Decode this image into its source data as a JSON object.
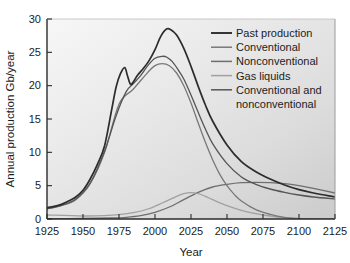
{
  "chart_data": {
    "type": "line",
    "title": "",
    "xlabel": "Year",
    "ylabel": "Annual production Gb/year",
    "xlim": [
      1925,
      2125
    ],
    "ylim": [
      0,
      30
    ],
    "xticks": [
      1925,
      1950,
      1975,
      2000,
      2025,
      2050,
      2075,
      2100,
      2125
    ],
    "yticks": [
      0,
      5,
      10,
      15,
      20,
      25,
      30
    ],
    "grid": false,
    "legend_position": "top-right inside axes",
    "series": [
      {
        "name": "Past production",
        "color": "#2c2c2c",
        "x": [
          1925,
          1930,
          1935,
          1940,
          1945,
          1950,
          1955,
          1960,
          1965,
          1970,
          1973,
          1976,
          1979,
          1981,
          1983,
          1985,
          1988,
          1992,
          1996,
          2000,
          2004,
          2008,
          2011,
          2015,
          2020,
          2025,
          2030,
          2035,
          2040,
          2050,
          2060,
          2070,
          2080,
          2090,
          2100,
          2110,
          2125
        ],
        "values": [
          1.7,
          1.9,
          2.2,
          2.7,
          3.3,
          4.3,
          6.0,
          8.2,
          11.0,
          16.5,
          19.8,
          21.8,
          22.7,
          21.4,
          20.2,
          20.6,
          21.6,
          22.6,
          23.8,
          25.4,
          27.4,
          28.5,
          28.4,
          27.6,
          25.6,
          22.9,
          19.9,
          17.1,
          14.7,
          11.1,
          8.6,
          7.1,
          6.0,
          5.1,
          4.4,
          3.9,
          3.3
        ]
      },
      {
        "name": "Conventional",
        "color": "#787878",
        "x": [
          1925,
          1935,
          1945,
          1955,
          1965,
          1975,
          1985,
          1995,
          2000,
          2005,
          2010,
          2015,
          2020,
          2025,
          2030,
          2035,
          2040,
          2045,
          2050,
          2055,
          2060,
          2070,
          2080,
          2090,
          2100,
          2110,
          2125
        ],
        "values": [
          1.5,
          2.0,
          2.9,
          5.3,
          10.0,
          17.2,
          19.5,
          22.0,
          23.0,
          23.3,
          23.0,
          21.9,
          20.0,
          17.4,
          14.4,
          11.5,
          8.9,
          6.7,
          5.0,
          3.7,
          2.7,
          1.4,
          0.7,
          0.25,
          0.05,
          0.0,
          0.0
        ]
      },
      {
        "name": "Nonconventional",
        "color": "#6e6e6e",
        "x": [
          1925,
          1950,
          1970,
          1980,
          1990,
          2000,
          2010,
          2020,
          2030,
          2040,
          2050,
          2060,
          2070,
          2080,
          2090,
          2100,
          2110,
          2125
        ],
        "values": [
          0.05,
          0.08,
          0.15,
          0.25,
          0.5,
          1.0,
          1.8,
          2.9,
          4.0,
          4.8,
          5.2,
          5.45,
          5.5,
          5.45,
          5.3,
          5.0,
          4.6,
          3.9
        ]
      },
      {
        "name": "Gas liquids",
        "color": "#a0a0a0",
        "x": [
          1925,
          1950,
          1965,
          1975,
          1985,
          1995,
          2005,
          2015,
          2020,
          2025,
          2030,
          2035,
          2040,
          2050,
          2060,
          2070,
          2080,
          2090,
          2100,
          2110,
          2125
        ],
        "values": [
          0.6,
          0.45,
          0.5,
          0.65,
          0.95,
          1.5,
          2.4,
          3.4,
          3.8,
          3.95,
          3.8,
          3.4,
          2.9,
          2.0,
          1.3,
          0.8,
          0.45,
          0.2,
          0.05,
          0.0,
          0.0
        ]
      },
      {
        "name": "Conventional and nonconventional",
        "color": "#555555",
        "x": [
          1925,
          1935,
          1945,
          1955,
          1965,
          1973,
          1980,
          1985,
          1990,
          1995,
          2000,
          2005,
          2008,
          2012,
          2016,
          2020,
          2025,
          2030,
          2035,
          2040,
          2050,
          2060,
          2070,
          2080,
          2090,
          2100,
          2110,
          2125
        ],
        "values": [
          1.55,
          2.05,
          3.0,
          5.4,
          10.2,
          15.5,
          19.1,
          20.3,
          21.5,
          23.0,
          24.1,
          24.4,
          24.3,
          23.6,
          22.4,
          21.0,
          18.6,
          16.0,
          13.5,
          11.3,
          8.3,
          6.3,
          5.2,
          4.5,
          4.0,
          3.6,
          3.3,
          3.0
        ]
      }
    ],
    "annotations": []
  },
  "legend": {
    "entries": [
      {
        "label": "Past production"
      },
      {
        "label": "Conventional"
      },
      {
        "label": "Nonconventional"
      },
      {
        "label": "Gas liquids"
      },
      {
        "label": "Conventional and"
      },
      {
        "label": "nonconventional"
      }
    ]
  },
  "axes": {
    "y_title": "Annual production Gb/year",
    "x_title": "Year",
    "y_tick_labels": [
      "30",
      "25",
      "20",
      "15",
      "10",
      "5",
      "0"
    ],
    "x_tick_labels": [
      "1925",
      "1950",
      "1975",
      "2000",
      "2025",
      "2050",
      "2075",
      "2100",
      "2125"
    ]
  },
  "style": {
    "plot_bg_light": "#f4f4f4",
    "plot_bg_dark": "#cfcfcf",
    "axis_color": "#2b2b2b",
    "text_color": "#1c1c1c"
  }
}
